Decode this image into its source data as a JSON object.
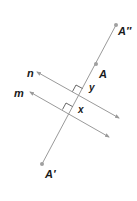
{
  "diagram": {
    "colors": {
      "line": "#9a9a9a",
      "point": "#a0a0a0",
      "text": "#1a1a1a",
      "background": "#ffffff"
    },
    "transversal": {
      "start": {
        "x": 42,
        "y": 164
      },
      "end": {
        "x": 116,
        "y": 25
      }
    },
    "lines": [
      {
        "id": "n",
        "label": "n",
        "from": {
          "x": 37,
          "y": 72
        },
        "to": {
          "x": 119,
          "y": 118
        },
        "label_pos": {
          "x": 27,
          "y": 77
        }
      },
      {
        "id": "m",
        "label": "m",
        "from": {
          "x": 30,
          "y": 92
        },
        "to": {
          "x": 109,
          "y": 137
        },
        "label_pos": {
          "x": 14,
          "y": 97
        }
      }
    ],
    "points": [
      {
        "id": "A-double-prime",
        "label": "A″",
        "x": 116,
        "y": 25,
        "label_pos": {
          "x": 118,
          "y": 35
        }
      },
      {
        "id": "A",
        "label": "A",
        "x": 96,
        "y": 64,
        "label_pos": {
          "x": 99,
          "y": 78
        }
      },
      {
        "id": "A-prime",
        "label": "A′",
        "x": 42,
        "y": 164,
        "label_pos": {
          "x": 45,
          "y": 178
        }
      }
    ],
    "distances": [
      {
        "id": "y",
        "label": "y",
        "label_pos": {
          "x": 89,
          "y": 91
        }
      },
      {
        "id": "x",
        "label": "x",
        "label_pos": {
          "x": 78,
          "y": 113
        }
      }
    ]
  }
}
